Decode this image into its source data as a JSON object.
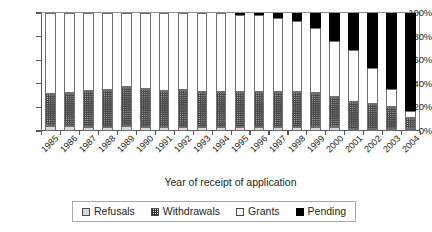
{
  "chart_data": {
    "type": "bar",
    "stacked": true,
    "stack_mode": "percent",
    "title": "",
    "xlabel": "Year of receipt of application",
    "ylabel": "",
    "ylim": [
      0,
      100
    ],
    "ytick_labels": [
      "0%",
      "20%",
      "40%",
      "60%",
      "80%",
      "100%"
    ],
    "ytick_values": [
      0,
      20,
      40,
      60,
      80,
      100
    ],
    "grid": false,
    "legend_position": "bottom",
    "categories": [
      "1985",
      "1986",
      "1987",
      "1988",
      "1989",
      "1990",
      "1991",
      "1992",
      "1993",
      "1994",
      "1995",
      "1996",
      "1997",
      "1998",
      "1999",
      "2000",
      "2001",
      "2002",
      "2003",
      "2004"
    ],
    "series": [
      {
        "name": "Refusals",
        "color": "#d9d9d9",
        "pattern": "solid-light-gray",
        "values": [
          4,
          4,
          3,
          3,
          4,
          3,
          3,
          3,
          3,
          3,
          3,
          3,
          3,
          3,
          3,
          3,
          2,
          2,
          2,
          1
        ]
      },
      {
        "name": "Withdrawals",
        "color": "#4a4a4a",
        "pattern": "checkerboard",
        "values": [
          27,
          28,
          31,
          32,
          33,
          33,
          31,
          32,
          30,
          30,
          30,
          30,
          30,
          30,
          29,
          26,
          23,
          21,
          18,
          9
        ]
      },
      {
        "name": "Grants",
        "color": "#ffffff",
        "pattern": "solid-white",
        "values": [
          69,
          68,
          66,
          65,
          63,
          64,
          66,
          65,
          67,
          67,
          66,
          65,
          63,
          60,
          55,
          47,
          44,
          30,
          16,
          6
        ]
      },
      {
        "name": "Pending",
        "color": "#000000",
        "pattern": "solid-black",
        "values": [
          0,
          0,
          0,
          0,
          0,
          0,
          0,
          0,
          0,
          0,
          1,
          2,
          4,
          7,
          13,
          24,
          31,
          47,
          64,
          84
        ]
      }
    ]
  },
  "axis": {
    "x_title": "Year of receipt of application"
  },
  "legend": {
    "items": [
      {
        "label": "Refusals",
        "swatch": "refusals-swatch"
      },
      {
        "label": "Withdrawals",
        "swatch": "withdrawals-swatch"
      },
      {
        "label": "Grants",
        "swatch": "grants-swatch"
      },
      {
        "label": "Pending",
        "swatch": "pending-swatch"
      }
    ]
  }
}
